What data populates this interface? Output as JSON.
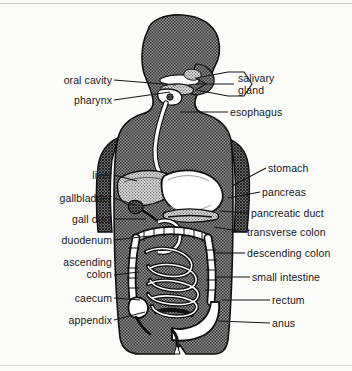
{
  "figure": {
    "background_color": "#fbfbfa",
    "line_color": "#17171a",
    "body_fill_color": "#6e6e6e",
    "organ_light_color": "#ffffff",
    "organ_mid_color": "#a8a8a8"
  },
  "labels_left": [
    {
      "id": "oral-cavity",
      "text": "oral cavity",
      "x": 44,
      "y": 74,
      "width": 68,
      "leader": {
        "x1": 114,
        "y1": 80,
        "x2": 176,
        "y2": 85
      }
    },
    {
      "id": "pharynx",
      "text": "pharynx",
      "x": 39,
      "y": 94,
      "width": 73,
      "leader": {
        "x1": 114,
        "y1": 100,
        "x2": 170,
        "y2": 92
      }
    },
    {
      "id": "liver",
      "text": "liver",
      "x": 40,
      "y": 169,
      "width": 72,
      "leader": {
        "x1": 114,
        "y1": 175,
        "x2": 137,
        "y2": 181
      }
    },
    {
      "id": "gallbladder",
      "text": "gallbladder",
      "x": 18,
      "y": 192,
      "width": 94,
      "leader": {
        "x1": 114,
        "y1": 198,
        "x2": 135,
        "y2": 205
      }
    },
    {
      "id": "gall-duct",
      "text": "gall duct",
      "x": 29,
      "y": 213,
      "width": 83,
      "leader": {
        "x1": 114,
        "y1": 219,
        "x2": 146,
        "y2": 219
      }
    },
    {
      "id": "duodenum",
      "text": "duodenum",
      "x": 21,
      "y": 234,
      "width": 91,
      "leader": {
        "x1": 114,
        "y1": 240,
        "x2": 150,
        "y2": 236
      }
    },
    {
      "id": "ascending-colon",
      "text": "ascending\ncolon",
      "x": 26,
      "y": 256,
      "width": 86,
      "leader": {
        "x1": 114,
        "y1": 275,
        "x2": 139,
        "y2": 272
      }
    },
    {
      "id": "caecum",
      "text": "caecum",
      "x": 40,
      "y": 292,
      "width": 72,
      "leader": {
        "x1": 114,
        "y1": 298,
        "x2": 140,
        "y2": 300
      }
    },
    {
      "id": "appendix",
      "text": "appendix",
      "x": 33,
      "y": 314,
      "width": 79,
      "leader": {
        "x1": 114,
        "y1": 320,
        "x2": 145,
        "y2": 312
      }
    }
  ],
  "labels_right": [
    {
      "id": "salivary-gland",
      "text": "salivary\ngland",
      "x": 238,
      "y": 72,
      "leader": {
        "x1": 234,
        "y1": 84,
        "x2": 196,
        "y2": 84
      }
    },
    {
      "id": "esophagus",
      "text": "esophagus",
      "x": 230,
      "y": 106,
      "leader": {
        "x1": 228,
        "y1": 112,
        "x2": 180,
        "y2": 112
      }
    },
    {
      "id": "stomach",
      "text": "stomach",
      "x": 268,
      "y": 162,
      "leader": {
        "x1": 266,
        "y1": 168,
        "x2": 232,
        "y2": 186
      }
    },
    {
      "id": "pancreas",
      "text": "pancreas",
      "x": 262,
      "y": 186,
      "leader": {
        "x1": 260,
        "y1": 192,
        "x2": 228,
        "y2": 198
      }
    },
    {
      "id": "pancreatic-duct",
      "text": "pancreatic duct",
      "x": 251,
      "y": 207,
      "leader": {
        "x1": 249,
        "y1": 213,
        "x2": 220,
        "y2": 211
      }
    },
    {
      "id": "transverse-colon",
      "text": "transverse colon",
      "x": 247,
      "y": 226,
      "leader": {
        "x1": 245,
        "y1": 232,
        "x2": 214,
        "y2": 227
      }
    },
    {
      "id": "descending-colon",
      "text": "descending colon",
      "x": 247,
      "y": 247,
      "leader": {
        "x1": 245,
        "y1": 253,
        "x2": 214,
        "y2": 253
      }
    },
    {
      "id": "small-intestine",
      "text": "small intestine",
      "x": 252,
      "y": 271,
      "leader": {
        "x1": 250,
        "y1": 277,
        "x2": 216,
        "y2": 277
      }
    },
    {
      "id": "rectum",
      "text": "rectum",
      "x": 272,
      "y": 294,
      "leader": {
        "x1": 270,
        "y1": 300,
        "x2": 222,
        "y2": 300
      }
    },
    {
      "id": "anus",
      "text": "anus",
      "x": 272,
      "y": 317,
      "leader": {
        "x1": 270,
        "y1": 323,
        "x2": 218,
        "y2": 321
      }
    }
  ]
}
